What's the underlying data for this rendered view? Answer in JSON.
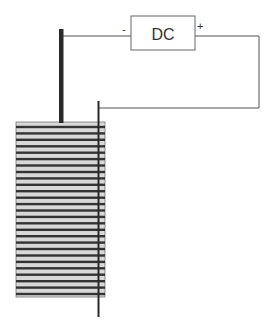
{
  "diagram": {
    "source": {
      "label": "DC",
      "negative_label": "-",
      "positive_label": "+"
    },
    "stack": {
      "stripe_count": 27,
      "fill_color": "#d8d8d8",
      "stripe_color": "#333333"
    },
    "colors": {
      "wire": "#555555",
      "electrode": "#2a2a2a",
      "box_border": "#666666"
    }
  }
}
